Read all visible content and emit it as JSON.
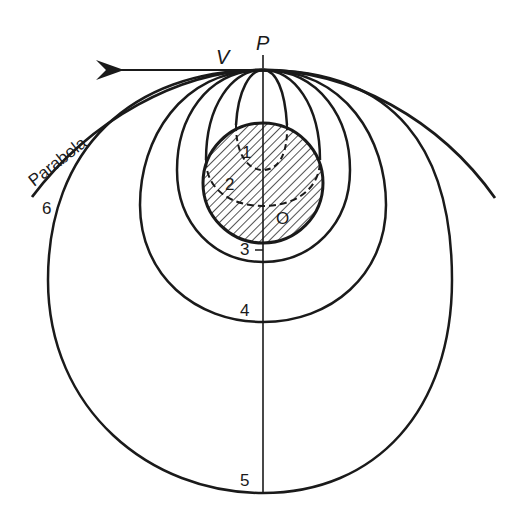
{
  "figure": {
    "colors": {
      "ink": "#1a1a1a",
      "background": "#ffffff"
    },
    "labels": {
      "point_top": "P",
      "velocity": "V",
      "center": "O",
      "parabola": "Parabola"
    },
    "orbits": [
      {
        "id": "1",
        "label": "1",
        "style": "dashed",
        "inside_earth": true
      },
      {
        "id": "2",
        "label": "2",
        "style": "dashed",
        "inside_earth": true
      },
      {
        "id": "3",
        "label": "3",
        "style": "solid",
        "inside_earth": false
      },
      {
        "id": "4",
        "label": "4",
        "style": "solid",
        "inside_earth": false
      },
      {
        "id": "5",
        "label": "5",
        "style": "solid",
        "inside_earth": false
      },
      {
        "id": "6",
        "label": "6",
        "style": "solid",
        "type": "parabola"
      }
    ],
    "earth": {
      "label": "O",
      "fill": "hatched"
    },
    "arrow": {
      "direction": "left",
      "label": "V"
    }
  }
}
